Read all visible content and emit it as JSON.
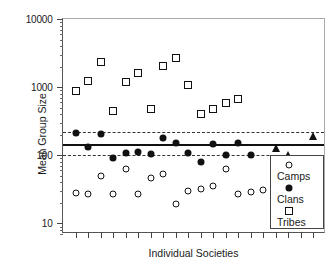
{
  "chart_data": {
    "type": "scatter",
    "title": "",
    "xlabel": "Individual Societies",
    "ylabel": "Mean Group Size",
    "yscale": "log",
    "ylim": [
      7,
      10000
    ],
    "ytick_labels": [
      "10000",
      "1000",
      "100",
      "10"
    ],
    "ytick_values": [
      10000,
      1000,
      100,
      10
    ],
    "xlim": [
      0,
      21
    ],
    "xtick_count": 20,
    "grid": false,
    "legend_position": "bottom-right",
    "series": [
      {
        "name": "Camps",
        "marker": "open-circle",
        "x": [
          1,
          2,
          3,
          4,
          5,
          6,
          7,
          8,
          9,
          10,
          11,
          12,
          13,
          14,
          15,
          16,
          17,
          18
        ],
        "values": [
          28,
          27,
          50,
          27,
          62,
          27,
          46,
          54,
          19,
          30,
          32,
          35,
          64,
          27,
          29,
          31,
          33,
          36
        ]
      },
      {
        "name": "Clans",
        "marker": "filled-circle",
        "x": [
          1,
          2,
          3,
          4,
          5,
          6,
          7,
          8,
          9,
          10,
          11,
          12,
          13,
          14,
          15
        ],
        "values": [
          215,
          133,
          205,
          91,
          108,
          112,
          106,
          180,
          150,
          107,
          81,
          148,
          100,
          152,
          102
        ]
      },
      {
        "name": "Tribes",
        "marker": "open-square",
        "x": [
          1,
          2,
          3,
          4,
          5,
          6,
          7,
          8,
          9,
          10,
          11,
          12,
          13,
          14
        ],
        "values": [
          870,
          1240,
          2300,
          450,
          1200,
          1630,
          480,
          2050,
          2700,
          1060,
          410,
          480,
          590,
          660
        ]
      },
      {
        "name": "Tribes (filled triangles)",
        "marker": "filled-triangle",
        "x": [
          17,
          18,
          20
        ],
        "values": [
          128,
          102,
          190
        ]
      }
    ],
    "reference_lines": [
      {
        "name": "mean",
        "value": 148,
        "style": "solid"
      },
      {
        "name": "upper",
        "value": 222,
        "style": "dashed"
      },
      {
        "name": "lower",
        "value": 100,
        "style": "dashed"
      }
    ]
  },
  "legend": {
    "entries": [
      {
        "label": "Camps",
        "symbol": "open-circle"
      },
      {
        "label": "Clans",
        "symbol": "filled-circle"
      },
      {
        "label": "Tribes",
        "symbol": "open-square"
      }
    ]
  }
}
